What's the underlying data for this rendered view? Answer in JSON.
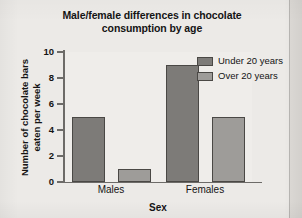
{
  "chart_data": {
    "type": "bar",
    "title": "Male/female differences in chocolate consumption by age",
    "title_line1": "Male/female differences in chocolate",
    "title_line2": "consumption by age",
    "xlabel": "Sex",
    "ylabel": "Number of chocolate bars eaten per week",
    "ylabel_line1": "Number of chocolate bars",
    "ylabel_line2": "eaten per week",
    "categories": [
      "Males",
      "Females"
    ],
    "series": [
      {
        "name": "Under 20 years",
        "values": [
          5,
          9
        ],
        "color": "#7d7b78"
      },
      {
        "name": "Over 20 years",
        "values": [
          1,
          5
        ],
        "color": "#9e9c99"
      }
    ],
    "ylim": [
      0,
      10
    ],
    "yticks": [
      0,
      2,
      4,
      6,
      8,
      10
    ],
    "ytick_labels": [
      "0",
      "2",
      "4",
      "6",
      "8",
      "10"
    ],
    "grid": false,
    "legend_position": "top-right-inside"
  },
  "legend": {
    "entries": [
      {
        "label": "Under 20 years",
        "color": "#7d7b78"
      },
      {
        "label": "Over 20 years",
        "color": "#9e9c99"
      }
    ]
  },
  "colors": {
    "under20": "#7d7b78",
    "over20": "#9e9c99",
    "bar_border": "#4a4845",
    "axis": "#6d6b68",
    "page_background": "#eceae7",
    "plot_background": "#efedea",
    "text": "#141414"
  }
}
